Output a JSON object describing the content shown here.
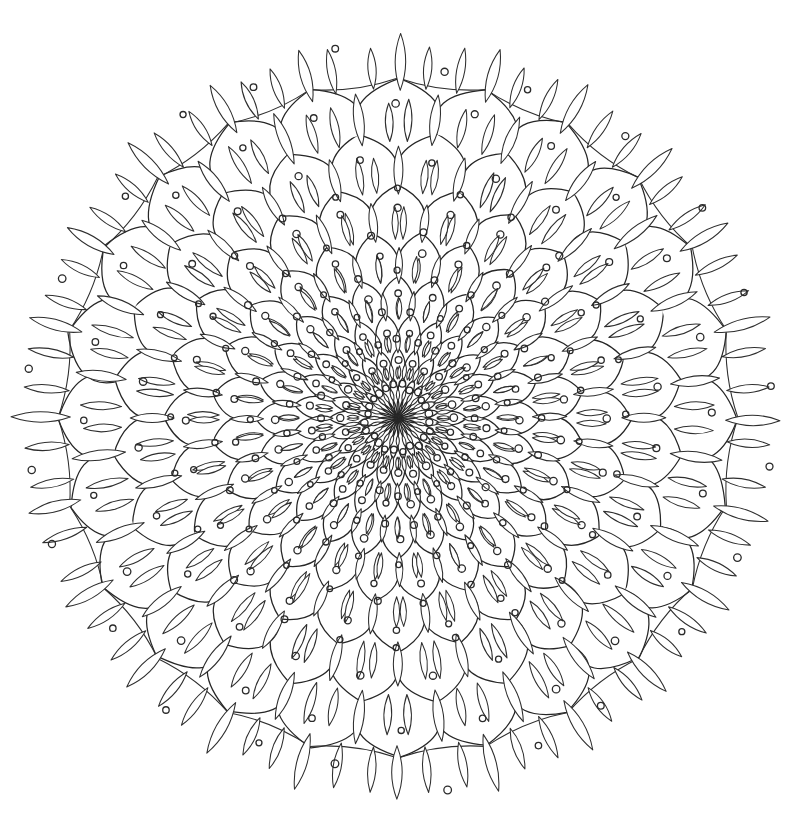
{
  "page": {
    "type": "line-art-coloring-page",
    "width": 792,
    "height": 830,
    "background_color": "#ffffff",
    "ink_color": "#262626"
  },
  "artwork": {
    "name": "dahlia-mandala",
    "center": {
      "x": 398,
      "y": 418
    },
    "symmetry_sectors": 24,
    "ring_count": 9,
    "outer_radius": 340,
    "motifs": [
      "overlapping-pointed-petals",
      "lens-shaped-leaf-spikes-at-junctions",
      "small-open-circle-dot-inside-each-petal",
      "free-floating-dots-outside-outer-boundary"
    ],
    "line_style": {
      "stroke": "#262626",
      "stroke_width": 1.25,
      "fill": "none"
    },
    "dot_style": {
      "stroke": "#2a2a2a",
      "stroke_width": 1.3,
      "radius": 3.4,
      "fill": "none"
    }
  },
  "chart_data": {
    "type": "polar-geometry",
    "sectors": 24,
    "ring_radii": [
      20,
      42,
      70,
      104,
      142,
      186,
      234,
      286,
      340
    ],
    "ring_sector_offsets_deg": [
      0,
      7.5,
      0,
      7.5,
      0,
      7.5,
      0,
      7.5,
      0
    ],
    "petal_tip_sharpness": [
      0.55,
      0.58,
      0.6,
      0.62,
      0.64,
      0.66,
      0.68,
      0.7,
      0.72
    ],
    "leaf_lengths": [
      12,
      16,
      22,
      28,
      34,
      40,
      46,
      52,
      56
    ],
    "leaf_widths": [
      3.2,
      4.0,
      5.0,
      6.0,
      7.0,
      8.0,
      9.0,
      10.0,
      10.5
    ],
    "dot_ring_radii": [
      32,
      56,
      88,
      124,
      165,
      210,
      260,
      313
    ],
    "outer_free_dot_radius": 362,
    "outer_free_dot_count": 24
  }
}
